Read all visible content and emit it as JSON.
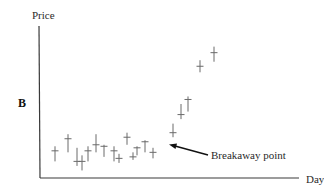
{
  "chart_data": {
    "type": "scatter",
    "subtype": "high-low-close price bars",
    "panel_label": "B",
    "title": "",
    "xlabel": "Day",
    "ylabel": "Price",
    "grid": false,
    "legend": null,
    "xlim": [
      0,
      20
    ],
    "ylim": [
      0,
      100
    ],
    "ticks": {
      "x": [],
      "y": []
    },
    "x": [
      1,
      2,
      3,
      4,
      5,
      6,
      7,
      8,
      9,
      10,
      11,
      12,
      13,
      14,
      15,
      16,
      17,
      18,
      19
    ],
    "series": [
      {
        "name": "High",
        "values": [
          21,
          29,
          20,
          15,
          21,
          29,
          22,
          21,
          16,
          30,
          17,
          21,
          25,
          20,
          36,
          49,
          54,
          78,
          87
        ]
      },
      {
        "name": "Low",
        "values": [
          11,
          17,
          8,
          5,
          11,
          17,
          14,
          11,
          10,
          22,
          12,
          15,
          17,
          13,
          27,
          39,
          44,
          70,
          77
        ]
      },
      {
        "name": "Close",
        "values": [
          18,
          26,
          11,
          11,
          18,
          22,
          21,
          18,
          13,
          27,
          14,
          20,
          24,
          17,
          30,
          42,
          52,
          74,
          83
        ]
      }
    ],
    "annotations": [
      {
        "text": "Breakaway point",
        "target_day": 15,
        "arrow": true
      }
    ]
  },
  "labels": {
    "ylabel": "Price",
    "xlabel": "Day",
    "panel": "B",
    "annotation": "Breakaway point"
  },
  "colors": {
    "axis": "#3a3a3a",
    "bars": "#6a6a6a",
    "text": "#2a2a2a"
  }
}
